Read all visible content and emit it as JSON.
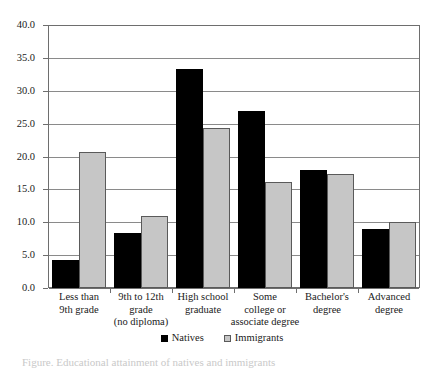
{
  "chart_data": {
    "type": "bar",
    "title": "",
    "subtitle": "",
    "xlabel": "",
    "ylabel": "",
    "ylim": [
      0,
      40
    ],
    "ytick_step": 5,
    "grid": true,
    "legend_position": "bottom",
    "categories": [
      "Less than\n9th grade",
      "9th to 12th\ngrade\n(no diploma)",
      "High school\ngraduate",
      "Some\ncollege or\nassociate degree",
      "Bachelor's\ndegree",
      "Advanced\ndegree"
    ],
    "ytick_labels": [
      "40.0",
      "35.0",
      "30.0",
      "25.0",
      "20.0",
      "15.0",
      "10.0",
      "5.0",
      "0.0"
    ],
    "ytick_values": [
      40.0,
      35.0,
      30.0,
      25.0,
      20.0,
      15.0,
      10.0,
      5.0,
      0.0
    ],
    "series": [
      {
        "name": "Natives",
        "color": "#000000",
        "values": [
          4.2,
          8.3,
          33.3,
          26.9,
          17.9,
          8.9
        ]
      },
      {
        "name": "Immigrants",
        "color": "#c6c6c6",
        "values": [
          20.7,
          11.0,
          24.3,
          16.1,
          17.4,
          10.0
        ]
      }
    ]
  },
  "legend": {
    "entries": [
      {
        "label": "Natives",
        "swatch": "natives-swatch"
      },
      {
        "label": "Immigrants",
        "swatch": "immigrants-swatch"
      }
    ]
  },
  "caption": {
    "text": "Figure. Educational attainment of natives and immigrants"
  },
  "colors": {
    "natives": "#000000",
    "immigrants": "#c6c6c6",
    "axis": "#6e6e6e",
    "grid": "#8a8a8a",
    "background": "#ffffff"
  }
}
